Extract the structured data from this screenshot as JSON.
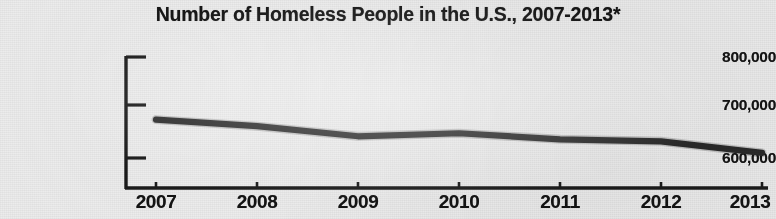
{
  "chart_data": {
    "type": "line",
    "title": "Number of Homeless People in the U.S., 2007-2013*",
    "xlabel": "",
    "ylabel": "",
    "categories": [
      "2007",
      "2008",
      "2009",
      "2010",
      "2011",
      "2012",
      "2013"
    ],
    "values": [
      676000,
      663000,
      643000,
      649000,
      637000,
      633000,
      610000
    ],
    "series": [
      {
        "name": "Number of Homeless People",
        "values": [
          676000,
          663000,
          643000,
          649000,
          637000,
          633000,
          610000
        ]
      }
    ],
    "ytick_labels": [
      "800,000",
      "700,000",
      "600,000"
    ],
    "ytick_values": [
      800000,
      700000,
      600000
    ],
    "ylim": [
      560000,
      800000
    ],
    "grid": false,
    "legend": false,
    "legend_position": "none",
    "line_color": "#2a2a2a",
    "background_color": "#ececec",
    "text_color": "#141414",
    "annotations": [
      "*"
    ]
  }
}
